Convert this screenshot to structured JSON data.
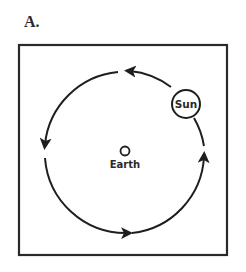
{
  "panel_label": "A.",
  "center_body": {
    "label": "Earth",
    "icon": "earth-circle-icon"
  },
  "orbiting_body": {
    "label": "Sun",
    "icon": "sun-circle-icon"
  },
  "orbit": {
    "direction": "counterclockwise",
    "arrow_count": 4
  },
  "colors": {
    "stroke": "#1e1e1e",
    "frame": "#2a2a2a",
    "text": "#2a2a2a",
    "background": "#ffffff"
  }
}
